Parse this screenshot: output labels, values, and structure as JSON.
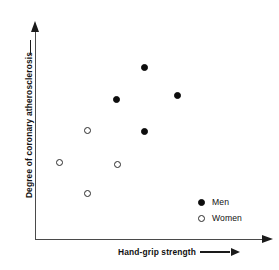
{
  "chart_data": {
    "type": "scatter",
    "title": "",
    "xlabel": "Hand-grip strength",
    "ylabel": "Degree of coronary atherosclerosis",
    "xlim": [
      0,
      100
    ],
    "ylim": [
      0,
      100
    ],
    "grid": false,
    "axis_ticks": false,
    "axis_arrows": {
      "x": "right",
      "y": "up"
    },
    "legend_position": "bottom-right",
    "series": [
      {
        "name": "Men",
        "marker": "filled-circle",
        "color": "#0d0d0d",
        "points": [
          {
            "x": 48.2,
            "y": 82.3
          },
          {
            "x": 35.8,
            "y": 66.9
          },
          {
            "x": 62.6,
            "y": 68.9
          },
          {
            "x": 48.2,
            "y": 51.7
          }
        ]
      },
      {
        "name": "Women",
        "marker": "open-circle",
        "color": "#2b2b2b",
        "points": [
          {
            "x": 22.6,
            "y": 52.2
          },
          {
            "x": 10.2,
            "y": 36.8
          },
          {
            "x": 36.2,
            "y": 35.9
          },
          {
            "x": 22.6,
            "y": 22.0
          }
        ]
      }
    ]
  },
  "legend": {
    "items": [
      {
        "label": "Men",
        "marker": "filled-circle"
      },
      {
        "label": "Women",
        "marker": "open-circle"
      }
    ]
  },
  "colors": {
    "background": "#ffffff",
    "axis": "#4a4a4a",
    "men_marker": "#0d0d0d",
    "women_marker": "#2b2b2b",
    "text": "#111111"
  }
}
